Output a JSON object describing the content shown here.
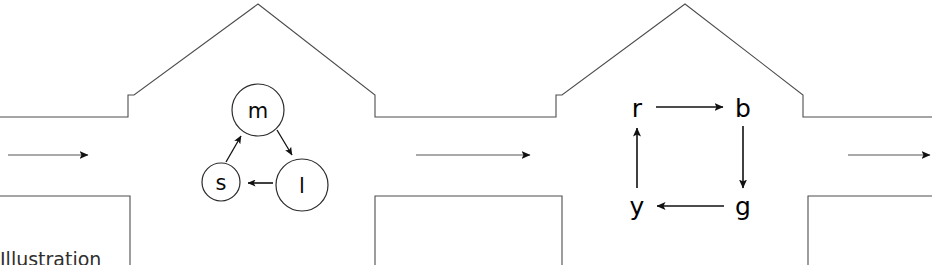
{
  "figure": {
    "background_color": "#ffffff",
    "line_color": "#4d4d4d",
    "ink_color": "#111111",
    "width": 932,
    "height": 265
  },
  "caption": {
    "clipped_text": "Illustration"
  },
  "flow_arrows": [
    {
      "name": "flow-arrow-left",
      "x1": 8,
      "x2": 88,
      "y": 155
    },
    {
      "name": "flow-arrow-center",
      "x1": 416,
      "x2": 530,
      "y": 155
    },
    {
      "name": "flow-arrow-right",
      "x1": 848,
      "x2": 930,
      "y": 155
    }
  ],
  "diagram_left": {
    "name": "cycle-diagram-circled",
    "style": "circled-nodes",
    "nodes": [
      {
        "id": "m",
        "label": "m",
        "cx": 258,
        "cy": 110,
        "r": 26
      },
      {
        "id": "l",
        "label": "l",
        "cx": 302,
        "cy": 185,
        "r": 26
      },
      {
        "id": "s",
        "label": "s",
        "cx": 221,
        "cy": 182,
        "r": 19
      }
    ],
    "edges": [
      {
        "from": "m",
        "to": "l"
      },
      {
        "from": "l",
        "to": "s"
      },
      {
        "from": "s",
        "to": "m"
      }
    ]
  },
  "diagram_right": {
    "name": "cycle-diagram-plain",
    "style": "plain-letters",
    "nodes": [
      {
        "id": "r",
        "label": "r",
        "cx": 637,
        "cy": 108
      },
      {
        "id": "b",
        "label": "b",
        "cx": 743,
        "cy": 108
      },
      {
        "id": "g",
        "label": "g",
        "cx": 743,
        "cy": 206
      },
      {
        "id": "y",
        "label": "y",
        "cx": 637,
        "cy": 206
      }
    ],
    "edges": [
      {
        "from": "r",
        "to": "b",
        "direction": "right"
      },
      {
        "from": "b",
        "to": "g",
        "direction": "down"
      },
      {
        "from": "g",
        "to": "y",
        "direction": "left"
      },
      {
        "from": "y",
        "to": "r",
        "direction": "up"
      }
    ]
  },
  "duct": {
    "name": "duct-profile",
    "upper_wall_y": 117,
    "lower_wall_y": 196,
    "peak_left_x": 258,
    "peak_right_x": 685,
    "peak_y": 4
  }
}
